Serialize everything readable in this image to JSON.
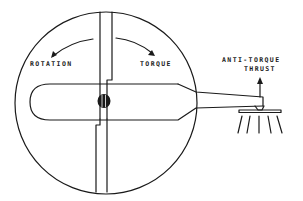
{
  "diagram": {
    "type": "helicopter-top-view-torque-diagram",
    "labels": {
      "rotation": "ROTATION",
      "torque": "TORQUE",
      "anti_torque_line1": "ANTI-TORQUE",
      "anti_torque_line2": "THRUST"
    },
    "colors": {
      "line": "#1a1a1a",
      "background": "#ffffff"
    }
  }
}
